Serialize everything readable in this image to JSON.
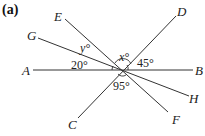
{
  "figure": {
    "label": "(a)",
    "points": {
      "A": "A",
      "B": "B",
      "C": "C",
      "D": "D",
      "E": "E",
      "F": "F",
      "G": "G",
      "H": "H"
    },
    "angles": {
      "AOG": "20°",
      "GOE": "y°",
      "EOD": "x°",
      "DOB": "45°",
      "COF": "95°"
    },
    "lines": [
      "AB",
      "EF",
      "GH",
      "DC"
    ]
  }
}
